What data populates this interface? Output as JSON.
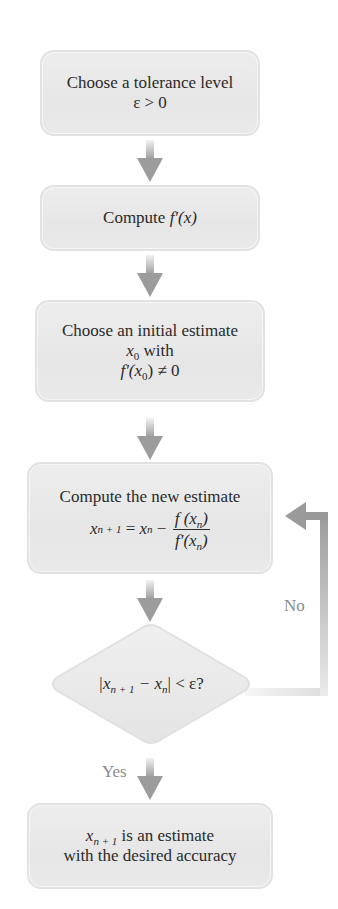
{
  "flowchart": {
    "step1": {
      "line1": "Choose a tolerance level",
      "line2": "ε > 0"
    },
    "step2": {
      "prefix": "Compute ",
      "expr": "f′(x)"
    },
    "step3": {
      "line1": "Choose an initial estimate",
      "line2_var": "x",
      "line2_sub": "0",
      "line2_rest": " with",
      "line3_prefix": "f′(x",
      "line3_sub": "0",
      "line3_rest": ") ≠ 0"
    },
    "step4": {
      "line1": "Compute the new estimate",
      "lhs_var": "x",
      "lhs_sub": "n + 1",
      "eq": " = ",
      "rhs_var": "x",
      "rhs_sub": "n",
      "minus": " − ",
      "num_prefix": "f (x",
      "num_sub": "n",
      "num_suffix": ")",
      "den_prefix": "f′(x",
      "den_sub": "n",
      "den_suffix": ")"
    },
    "decision": {
      "open": "|x",
      "sub1": "n + 1",
      "minus": " − x",
      "sub2": "n",
      "close": "| < ε?"
    },
    "step5": {
      "var": "x",
      "sub": "n + 1",
      "line1_rest": " is an estimate",
      "line2": "with the desired accuracy"
    },
    "labels": {
      "no": "No",
      "yes": "Yes"
    }
  },
  "colors": {
    "box_fill": "#e9e9e9",
    "box_border": "#e2e2e2",
    "arrow": "#9a9a9a",
    "label": "#8c8c8c",
    "text": "#2a2a2a"
  }
}
